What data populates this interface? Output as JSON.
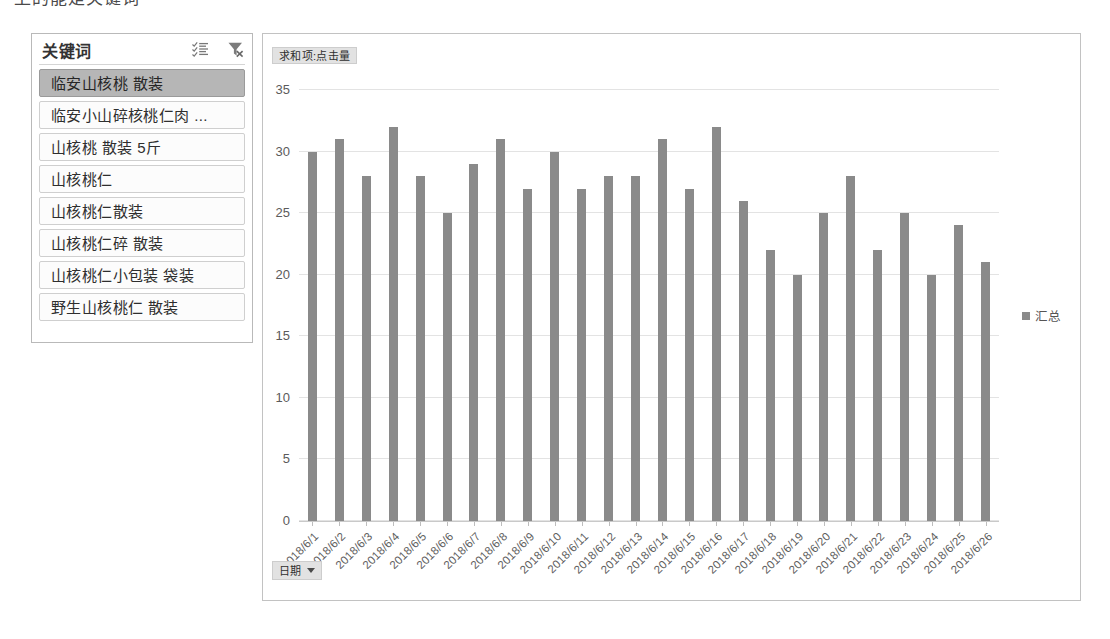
{
  "top_cut_text": "上的能是关键词",
  "slicer": {
    "title": "关键词",
    "icons": [
      {
        "name": "multi-select-icon",
        "label": "multi-select"
      },
      {
        "name": "clear-filter-icon",
        "label": "clear-filter"
      }
    ],
    "items": [
      {
        "label": "临安山核桃 散装",
        "selected": true
      },
      {
        "label": "临安小山碎核桃仁肉 ...",
        "selected": false
      },
      {
        "label": "山核桃 散装 5斤",
        "selected": false
      },
      {
        "label": "山核桃仁",
        "selected": false
      },
      {
        "label": "山核桃仁散装",
        "selected": false
      },
      {
        "label": "山核桃仁碎 散装",
        "selected": false
      },
      {
        "label": "山核桃仁小包装 袋装",
        "selected": false
      },
      {
        "label": "野生山核桃仁 散装",
        "selected": false
      }
    ]
  },
  "chart": {
    "value_field_button": "求和项:点击量",
    "axis_field_button": "日期",
    "legend_label": "汇总",
    "bar_color": "#8a8a8a",
    "gridline_color": "#e3e3e3"
  },
  "chart_data": {
    "type": "bar",
    "title": "求和项:点击量",
    "xlabel": "日期",
    "ylabel": "",
    "ylim": [
      0,
      35
    ],
    "yticks": [
      0,
      5,
      10,
      15,
      20,
      25,
      30,
      35
    ],
    "grid": true,
    "legend_position": "right",
    "legend": [
      "汇总"
    ],
    "categories": [
      "2018/6/1",
      "2018/6/2",
      "2018/6/3",
      "2018/6/4",
      "2018/6/5",
      "2018/6/6",
      "2018/6/7",
      "2018/6/8",
      "2018/6/9",
      "2018/6/10",
      "2018/6/11",
      "2018/6/12",
      "2018/6/13",
      "2018/6/14",
      "2018/6/15",
      "2018/6/16",
      "2018/6/17",
      "2018/6/18",
      "2018/6/19",
      "2018/6/20",
      "2018/6/21",
      "2018/6/22",
      "2018/6/23",
      "2018/6/24",
      "2018/6/25",
      "2018/6/26"
    ],
    "series": [
      {
        "name": "汇总",
        "values": [
          30,
          31,
          28,
          32,
          28,
          25,
          29,
          31,
          27,
          30,
          27,
          28,
          28,
          31,
          27,
          32,
          26,
          22,
          20,
          25,
          28,
          22,
          25,
          20,
          24,
          21
        ]
      }
    ]
  }
}
